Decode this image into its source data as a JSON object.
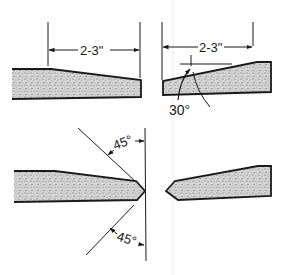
{
  "diagram": {
    "colors": {
      "ink": "#1a1a1a",
      "stipple_fill": "#bdbdbd",
      "background": "#ffffff"
    },
    "top_left_profile": {
      "dimension_label": "2-3\""
    },
    "top_right_profile": {
      "dimension_label": "2-3\"",
      "angle_label": "30°"
    },
    "bottom_left_profile": {
      "upper_angle_label": "45°",
      "lower_angle_label": "45°"
    },
    "bottom_right_profile": {}
  }
}
